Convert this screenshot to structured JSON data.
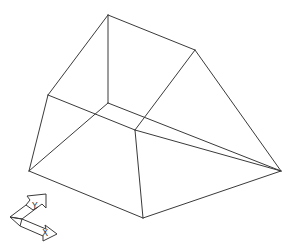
{
  "viewport": {
    "background": "#ffffff",
    "line_color": "#3a3a3a",
    "style": "wireframe"
  },
  "model": {
    "name": "wireframe-frustum",
    "vertices": {
      "A": [
        108,
        15
      ],
      "B": [
        195,
        50
      ],
      "C": [
        48,
        95
      ],
      "D": [
        108,
        103
      ],
      "E": [
        135,
        130
      ],
      "F": [
        29,
        171
      ],
      "G": [
        281,
        171
      ],
      "H": [
        143,
        218
      ]
    },
    "edges": [
      [
        "A",
        "B"
      ],
      [
        "A",
        "C"
      ],
      [
        "A",
        "D"
      ],
      [
        "B",
        "E"
      ],
      [
        "B",
        "G"
      ],
      [
        "C",
        "E"
      ],
      [
        "C",
        "F"
      ],
      [
        "E",
        "G"
      ],
      [
        "D",
        "F"
      ],
      [
        "D",
        "G"
      ],
      [
        "E",
        "H"
      ],
      [
        "F",
        "H"
      ],
      [
        "H",
        "G"
      ]
    ]
  },
  "ucs_icon": {
    "x_label": "X",
    "y_label": "Y"
  }
}
